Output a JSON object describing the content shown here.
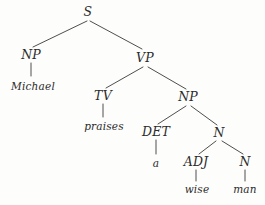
{
  "figure": {
    "kind": "syntax-tree",
    "sentence": "Michael praises a wise man",
    "width": 265,
    "height": 205,
    "line_color": "#3a3a3a",
    "text_color": "#2b2b2b",
    "background_color": "#fdfdfc"
  },
  "nodes": [
    {
      "id": "s",
      "label": "S",
      "type": "category",
      "x": 88,
      "y": 12
    },
    {
      "id": "np1",
      "label": "NP",
      "type": "category",
      "x": 31,
      "y": 55
    },
    {
      "id": "vp",
      "label": "VP",
      "type": "category",
      "x": 145,
      "y": 58
    },
    {
      "id": "michael",
      "label": "Michael",
      "type": "leaf",
      "x": 33,
      "y": 86
    },
    {
      "id": "tv",
      "label": "TV",
      "type": "category",
      "x": 103,
      "y": 96
    },
    {
      "id": "np2",
      "label": "NP",
      "type": "category",
      "x": 188,
      "y": 97
    },
    {
      "id": "praises",
      "label": "praises",
      "type": "leaf",
      "x": 104,
      "y": 126
    },
    {
      "id": "det",
      "label": "DET",
      "type": "category",
      "x": 156,
      "y": 132
    },
    {
      "id": "n1",
      "label": "N",
      "type": "category",
      "x": 219,
      "y": 133
    },
    {
      "id": "a",
      "label": "a",
      "type": "leaf",
      "x": 156,
      "y": 163
    },
    {
      "id": "adj",
      "label": "ADJ",
      "type": "category",
      "x": 196,
      "y": 162
    },
    {
      "id": "n2",
      "label": "N",
      "type": "category",
      "x": 245,
      "y": 162
    },
    {
      "id": "wise",
      "label": "wise",
      "type": "leaf",
      "x": 197,
      "y": 189
    },
    {
      "id": "man",
      "label": "man",
      "type": "leaf",
      "x": 245,
      "y": 189
    }
  ],
  "edges": [
    {
      "from": "s",
      "to": "np1",
      "x1": 87,
      "y1": 21,
      "x2": 33,
      "y2": 47
    },
    {
      "from": "s",
      "to": "vp",
      "x1": 90,
      "y1": 21,
      "x2": 142,
      "y2": 49
    },
    {
      "from": "np1",
      "to": "michael",
      "x1": 31,
      "y1": 63,
      "x2": 31,
      "y2": 76
    },
    {
      "from": "vp",
      "to": "tv",
      "x1": 143,
      "y1": 67,
      "x2": 106,
      "y2": 88
    },
    {
      "from": "vp",
      "to": "np2",
      "x1": 148,
      "y1": 67,
      "x2": 186,
      "y2": 89
    },
    {
      "from": "tv",
      "to": "praises",
      "x1": 103,
      "y1": 104,
      "x2": 103,
      "y2": 117
    },
    {
      "from": "np2",
      "to": "det",
      "x1": 186,
      "y1": 106,
      "x2": 158,
      "y2": 124
    },
    {
      "from": "np2",
      "to": "n1",
      "x1": 191,
      "y1": 106,
      "x2": 217,
      "y2": 125
    },
    {
      "from": "det",
      "to": "a",
      "x1": 156,
      "y1": 140,
      "x2": 156,
      "y2": 154
    },
    {
      "from": "n1",
      "to": "adj",
      "x1": 216,
      "y1": 141,
      "x2": 199,
      "y2": 154
    },
    {
      "from": "n1",
      "to": "n2",
      "x1": 222,
      "y1": 141,
      "x2": 243,
      "y2": 154
    },
    {
      "from": "adj",
      "to": "wise",
      "x1": 196,
      "y1": 170,
      "x2": 196,
      "y2": 181
    },
    {
      "from": "n2",
      "to": "man",
      "x1": 245,
      "y1": 170,
      "x2": 245,
      "y2": 181
    }
  ]
}
